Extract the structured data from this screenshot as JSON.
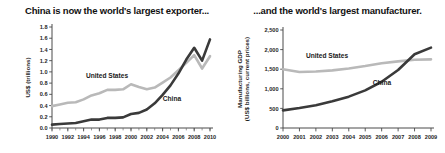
{
  "figure": {
    "panels": [
      "left",
      "right"
    ]
  },
  "left": {
    "title": "China is now the world's largest exporter...",
    "series_labels": {
      "us": "United States",
      "china": "China"
    }
  },
  "right": {
    "title": "...and the world's largest manufacturer.",
    "series_labels": {
      "us": "United States",
      "china": "China"
    }
  },
  "colors": {
    "united_states": "#b9b9b9",
    "china": "#3a3a3a",
    "axis": "#4a4a4a",
    "text": "#1a1a1a",
    "background": "#ffffff"
  },
  "chart_data": [
    {
      "type": "line",
      "title": "China is now the world's largest exporter...",
      "xlabel": "",
      "ylabel": "US$ (trillions)",
      "x": [
        1990,
        1991,
        1992,
        1993,
        1994,
        1995,
        1996,
        1997,
        1998,
        1999,
        2000,
        2001,
        2002,
        2003,
        2004,
        2005,
        2006,
        2007,
        2008,
        2009,
        2010
      ],
      "xticklabels": [
        "1990",
        "1992",
        "1994",
        "1996",
        "1998",
        "2000",
        "2002",
        "2004",
        "2006",
        "2008",
        "2010"
      ],
      "xtickvalues": [
        1990,
        1992,
        1994,
        1996,
        1998,
        2000,
        2002,
        2004,
        2006,
        2008,
        2010
      ],
      "xlim": [
        1990,
        2010
      ],
      "ylim": [
        0.0,
        1.8
      ],
      "yticks": [
        0.0,
        0.2,
        0.4,
        0.6,
        0.8,
        1.0,
        1.2,
        1.4,
        1.6,
        1.8
      ],
      "yticklabels": [
        "0.0",
        "0.2",
        "0.4",
        "0.6",
        "0.8",
        "1.0",
        "1.2",
        "1.4",
        "1.6",
        "1.8"
      ],
      "grid": false,
      "legend": "inline-annotations",
      "series": [
        {
          "name": "United States",
          "color": "#b9b9b9",
          "values": [
            0.39,
            0.42,
            0.45,
            0.46,
            0.51,
            0.58,
            0.62,
            0.68,
            0.68,
            0.69,
            0.78,
            0.73,
            0.69,
            0.72,
            0.81,
            0.9,
            1.03,
            1.16,
            1.3,
            1.06,
            1.28
          ]
        },
        {
          "name": "China",
          "color": "#3a3a3a",
          "values": [
            0.06,
            0.07,
            0.08,
            0.09,
            0.12,
            0.15,
            0.15,
            0.18,
            0.18,
            0.19,
            0.25,
            0.27,
            0.33,
            0.44,
            0.59,
            0.76,
            0.97,
            1.22,
            1.43,
            1.2,
            1.58
          ]
        }
      ]
    },
    {
      "type": "line",
      "title": "...and the world's largest manufacturer.",
      "xlabel": "",
      "ylabel": "Manufacturing GDP (US$ billions, current prices)",
      "x": [
        2000,
        2001,
        2002,
        2003,
        2004,
        2005,
        2006,
        2007,
        2008,
        2009
      ],
      "xticklabels": [
        "2000",
        "2001",
        "2002",
        "2003",
        "2004",
        "2005",
        "2006",
        "2007",
        "2008",
        "2009"
      ],
      "xtickvalues": [
        2000,
        2001,
        2002,
        2003,
        2004,
        2005,
        2006,
        2007,
        2008,
        2009
      ],
      "xlim": [
        2000,
        2009
      ],
      "ylim": [
        0,
        2500
      ],
      "yticks": [
        0,
        500,
        1000,
        1500,
        2000,
        2500
      ],
      "yticklabels": [
        "0",
        "500",
        "1,000",
        "1,500",
        "2,000",
        "2,500"
      ],
      "grid": false,
      "legend": "inline-annotations",
      "series": [
        {
          "name": "United States",
          "color": "#b9b9b9",
          "values": [
            1500,
            1430,
            1440,
            1470,
            1520,
            1580,
            1650,
            1700,
            1740,
            1750
          ]
        },
        {
          "name": "China",
          "color": "#3a3a3a",
          "values": [
            450,
            510,
            580,
            680,
            800,
            960,
            1180,
            1480,
            1880,
            2050
          ]
        }
      ]
    }
  ]
}
